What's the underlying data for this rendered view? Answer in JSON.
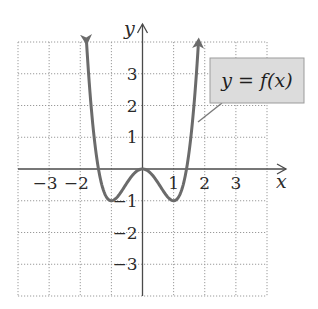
{
  "chart_data": {
    "type": "line",
    "title": "",
    "xlabel": "x",
    "ylabel": "y",
    "xlim": [
      -4,
      4
    ],
    "ylim": [
      -4,
      4
    ],
    "grid": true,
    "x_ticks": [
      -3,
      -2,
      1,
      2,
      3
    ],
    "x_tick_labels": [
      "−3",
      "−2",
      "1",
      "2",
      "3"
    ],
    "y_ticks": [
      3,
      2,
      1,
      -1,
      -2,
      -3
    ],
    "y_tick_labels": [
      "3",
      "2",
      "1",
      "−1",
      "−2",
      "−3"
    ],
    "series": [
      {
        "name": "y = f(x)",
        "color": "#6b6b6b",
        "description": "W-shaped curve with local maximum at (0, 0), local minima at (-1, -1) and (1, -1), arrows at both ends going up",
        "x": [
          -1.8,
          -1.5,
          -1.25,
          -1,
          -0.75,
          -0.5,
          -0.25,
          0,
          0.25,
          0.5,
          0.75,
          1,
          1.25,
          1.5,
          1.8
        ],
        "y": [
          4.0,
          0.56,
          -0.68,
          -1,
          -0.81,
          -0.44,
          -0.12,
          0,
          -0.12,
          -0.44,
          -0.81,
          -1,
          -0.68,
          0.56,
          4.0
        ],
        "end_arrows": true
      }
    ],
    "legend": {
      "entries": [
        "y = f(x)"
      ],
      "position": "upper-right callout box with pointer to curve"
    }
  },
  "labels": {
    "x_axis": "x",
    "y_axis": "y",
    "callout": "y = f(x)"
  }
}
